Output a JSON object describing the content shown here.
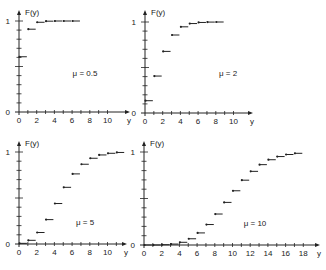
{
  "figure": {
    "panel_count": 4,
    "ink_color": "#222222",
    "background": "#ffffff"
  },
  "chart_data": [
    {
      "type": "line",
      "subtype": "step-cdf",
      "title": "",
      "annotation": "μ = 0.5",
      "xlabel": "y",
      "ylabel": "F(y)",
      "xlim": [
        0,
        11
      ],
      "ylim": [
        0,
        1
      ],
      "x_ticks": [
        0,
        2,
        4,
        6,
        8,
        10
      ],
      "y_ticks_labeled": [
        0,
        1
      ],
      "y_minor_ticks": 10,
      "grid": false,
      "x": [
        0,
        1,
        2,
        3,
        4,
        5,
        6
      ],
      "values": [
        0.607,
        0.91,
        0.986,
        0.998,
        1.0,
        1.0,
        1.0
      ]
    },
    {
      "type": "line",
      "subtype": "step-cdf",
      "title": "",
      "annotation": "μ = 2",
      "xlabel": "y",
      "ylabel": "F(y)",
      "xlim": [
        0,
        11
      ],
      "ylim": [
        0,
        1
      ],
      "x_ticks": [
        0,
        2,
        4,
        6,
        8,
        10
      ],
      "y_ticks_labeled": [
        0,
        1
      ],
      "y_minor_ticks": 10,
      "grid": false,
      "x": [
        0,
        1,
        2,
        3,
        4,
        5,
        6,
        7,
        8
      ],
      "values": [
        0.135,
        0.406,
        0.677,
        0.857,
        0.947,
        0.983,
        0.995,
        0.999,
        1.0
      ]
    },
    {
      "type": "line",
      "subtype": "step-cdf",
      "title": "",
      "annotation": "μ = 5",
      "xlabel": "y",
      "ylabel": "F(y)",
      "xlim": [
        0,
        12
      ],
      "ylim": [
        0,
        1
      ],
      "x_ticks": [
        0,
        2,
        4,
        6,
        8,
        10
      ],
      "y_ticks_labeled": [
        0,
        1
      ],
      "y_minor_ticks": 10,
      "grid": false,
      "x": [
        0,
        1,
        2,
        3,
        4,
        5,
        6,
        7,
        8,
        9,
        10,
        11
      ],
      "values": [
        0.007,
        0.04,
        0.125,
        0.265,
        0.44,
        0.616,
        0.762,
        0.867,
        0.932,
        0.968,
        0.986,
        0.995
      ]
    },
    {
      "type": "line",
      "subtype": "step-cdf",
      "title": "",
      "annotation": "μ = 10",
      "xlabel": "y",
      "ylabel": "F(y)",
      "xlim": [
        0,
        19
      ],
      "ylim": [
        0,
        1
      ],
      "x_ticks": [
        0,
        2,
        4,
        6,
        8,
        10,
        12,
        14,
        16,
        18
      ],
      "y_ticks_labeled": [
        0,
        1
      ],
      "y_minor_ticks": 10,
      "grid": false,
      "x": [
        0,
        1,
        2,
        3,
        4,
        5,
        6,
        7,
        8,
        9,
        10,
        11,
        12,
        13,
        14,
        15,
        16,
        17
      ],
      "values": [
        0.0,
        0.0,
        0.003,
        0.01,
        0.029,
        0.067,
        0.13,
        0.22,
        0.333,
        0.458,
        0.583,
        0.697,
        0.792,
        0.864,
        0.917,
        0.951,
        0.973,
        0.986
      ]
    }
  ],
  "layout": {
    "panels": [
      {
        "ox": 19,
        "oy": 112,
        "ppu": 8.85,
        "ptop": 21,
        "xend": 130,
        "ytop": 10
      },
      {
        "ox": 145,
        "oy": 113,
        "ppu": 8.85,
        "ptop": 22,
        "xend": 253,
        "ytop": 10
      },
      {
        "ox": 19,
        "oy": 244,
        "ppu": 8.85,
        "ptop": 152,
        "xend": 127,
        "ytop": 141
      },
      {
        "ox": 144,
        "oy": 245,
        "ppu": 8.85,
        "ptop": 152,
        "xend": 320,
        "ytop": 141
      }
    ],
    "annotation_pos": [
      {
        "x": 85,
        "y": 76
      },
      {
        "x": 228,
        "y": 76
      },
      {
        "x": 85,
        "y": 225
      },
      {
        "x": 255,
        "y": 226
      }
    ]
  }
}
